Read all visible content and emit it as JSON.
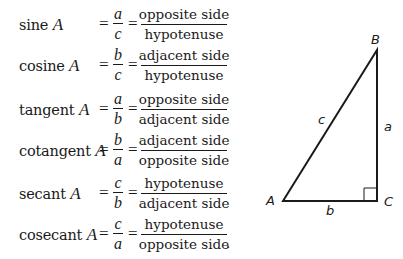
{
  "definitions": [
    {
      "function": "sine",
      "variable": "A",
      "ratio_num": "a",
      "ratio_den": "c",
      "word_num": "opposite side",
      "word_den": "hypotenuse"
    },
    {
      "function": "cosine",
      "variable": "A",
      "ratio_num": "b",
      "ratio_den": "c",
      "word_num": "adjacent side",
      "word_den": "hypotenuse"
    },
    {
      "function": "tangent",
      "variable": "A",
      "ratio_num": "a",
      "ratio_den": "b",
      "word_num": "opposite side",
      "word_den": "adjacent side"
    },
    {
      "function": "cotangent",
      "variable": "A",
      "ratio_num": "b",
      "ratio_den": "a",
      "word_num": "adjacent side",
      "word_den": "opposite side"
    },
    {
      "function": "secant",
      "variable": "A",
      "ratio_num": "c",
      "ratio_den": "b",
      "word_num": "hypotenuse",
      "word_den": "adjacent side"
    },
    {
      "function": "cosecant",
      "variable": "A",
      "ratio_num": "c",
      "ratio_den": "a",
      "word_num": "hypotenuse",
      "word_den": "opposite side"
    }
  ],
  "equals_sign": "=",
  "final_period": ".",
  "triangle": {
    "vertices": {
      "A": "A",
      "B": "B",
      "C": "C"
    },
    "sides": {
      "hypotenuse": "c",
      "vertical": "a",
      "base": "b"
    },
    "right_angle_at": "C"
  }
}
